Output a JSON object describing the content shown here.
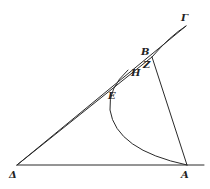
{
  "figure": {
    "type": "geometric-diagram",
    "labels": {
      "gamma": "Γ",
      "beta": "B",
      "zeta": "Z",
      "eta": "H",
      "epsilon": "E",
      "delta": "Δ",
      "alpha": "A"
    },
    "points": {
      "Gamma": [
        186,
        26
      ],
      "B": [
        152,
        57
      ],
      "Z": [
        155,
        68
      ],
      "H": [
        146,
        74
      ],
      "E": [
        113,
        98
      ],
      "Delta": [
        17,
        165
      ],
      "A": [
        187,
        165
      ]
    },
    "colors": {
      "ink": "#2a2a2a",
      "background": "#ffffff"
    }
  }
}
